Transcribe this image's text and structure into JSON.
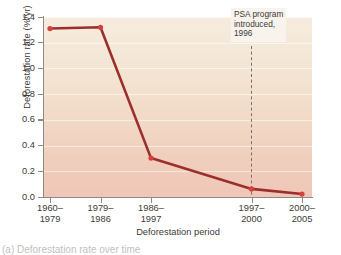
{
  "chart_data": {
    "type": "line",
    "title": "",
    "xlabel": "Deforestation period",
    "ylabel": "Deforestation rate (%/yr)",
    "categories": [
      "1960–\n1979",
      "1979–\n1986",
      "1986–\n1997",
      "1997–\n2000",
      "2000–\n2005"
    ],
    "category_lines": [
      [
        "1960–",
        "1979"
      ],
      [
        "1979–",
        "1986"
      ],
      [
        "1986–",
        "1997"
      ],
      [
        "1997–",
        "2000"
      ],
      [
        "2000–",
        "2005"
      ]
    ],
    "values": [
      1.31,
      1.32,
      0.3,
      0.06,
      0.02
    ],
    "ylim": [
      0.0,
      1.4
    ],
    "ytick_labels": [
      "0.0",
      "0.2",
      "0.4",
      "0.6",
      "0.8",
      "1.0",
      "1.2",
      "1.4"
    ],
    "ytick_values": [
      0.0,
      0.2,
      0.4,
      0.6,
      0.8,
      1.0,
      1.2,
      1.4
    ],
    "grid": true,
    "legend": "none",
    "series_color": "#9c2f2c",
    "marker_color": "#d4413c",
    "annotations": [
      {
        "text": "PSA program\nintroduced,\n1996",
        "at_category": "1997–\n2000",
        "line_style": "dashed",
        "line_color": "#7a6f66"
      }
    ]
  },
  "axes": {
    "y_title": "Deforestation rate (%/yr)",
    "x_title": "Deforestation period"
  },
  "annotation": {
    "text": "PSA program\nintroduced,\n1996"
  },
  "caption": {
    "text": "(a) Deforestation rate over time"
  },
  "colors": {
    "line": "#9c2f2c",
    "marker": "#d4413c",
    "axis": "#8c8a86",
    "plot_bg_top": "#f6ecdd",
    "plot_bg_bottom": "#efc6b7",
    "annotation_bg": "#f8f3ec",
    "text": "#3c3a38"
  }
}
